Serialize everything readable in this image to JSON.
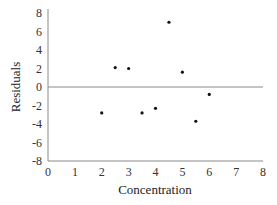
{
  "chart_data": {
    "type": "scatter",
    "title": "",
    "xlabel": "Concentration",
    "ylabel": "Residuals",
    "xlim": [
      0,
      8
    ],
    "ylim": [
      -8,
      8
    ],
    "x_ticks": [
      "0",
      "1",
      "2",
      "3",
      "4",
      "5",
      "6",
      "7",
      "8"
    ],
    "y_ticks": [
      "8",
      "6",
      "4",
      "2",
      "0",
      "-2",
      "-4",
      "-6",
      "-8"
    ],
    "grid": false,
    "legend": null,
    "reference_line": {
      "y": 0,
      "color": "#8a8a8a"
    },
    "series": [
      {
        "name": "Residuals",
        "marker_color": "#111111",
        "points": [
          {
            "x": 2.0,
            "y": -2.8
          },
          {
            "x": 2.5,
            "y": 2.1
          },
          {
            "x": 3.0,
            "y": 2.0
          },
          {
            "x": 3.5,
            "y": -2.8
          },
          {
            "x": 4.0,
            "y": -2.3
          },
          {
            "x": 4.5,
            "y": 7.0
          },
          {
            "x": 5.0,
            "y": 1.6
          },
          {
            "x": 5.5,
            "y": -3.7
          },
          {
            "x": 6.0,
            "y": -0.8
          }
        ]
      }
    ],
    "axis_color": "#8a8a8a"
  }
}
